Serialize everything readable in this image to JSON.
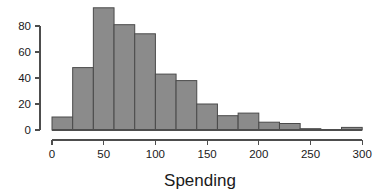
{
  "chart_data": {
    "type": "bar",
    "title": "",
    "subtitle": "",
    "xlabel": "Spending",
    "ylabel": "",
    "bin_width": 20,
    "bin_edges": [
      0,
      20,
      40,
      60,
      80,
      100,
      120,
      140,
      160,
      180,
      200,
      220,
      240,
      260,
      280,
      300
    ],
    "categories": [
      "0-20",
      "20-40",
      "40-60",
      "60-80",
      "80-100",
      "100-120",
      "120-140",
      "140-160",
      "160-180",
      "180-200",
      "200-220",
      "220-240",
      "240-260",
      "260-280",
      "280-300"
    ],
    "values": [
      10,
      48,
      94,
      81,
      74,
      43,
      38,
      20,
      11,
      13,
      6,
      5,
      1,
      0,
      2
    ],
    "x": [
      0,
      20,
      40,
      60,
      80,
      100,
      120,
      140,
      160,
      180,
      200,
      220,
      240,
      260,
      280
    ],
    "xlim": [
      0,
      300
    ],
    "ylim": [
      0,
      94
    ],
    "xticks": [
      0,
      50,
      100,
      150,
      200,
      250,
      300
    ],
    "xtick_labels": [
      "0",
      "50",
      "100",
      "150",
      "200",
      "250",
      "300"
    ],
    "yticks": [
      0,
      20,
      40,
      60,
      80
    ],
    "ytick_labels": [
      "0",
      "20",
      "40",
      "60",
      "80"
    ],
    "grid": false,
    "legend": false,
    "legend_position": "none",
    "bar_fill_color": "#8b8b8b",
    "bar_edge_color": "#4a4a4a",
    "axis_color": "#4d4d4d",
    "background_color": "#ffffff"
  },
  "axis_titles": {
    "x": "Spending"
  }
}
